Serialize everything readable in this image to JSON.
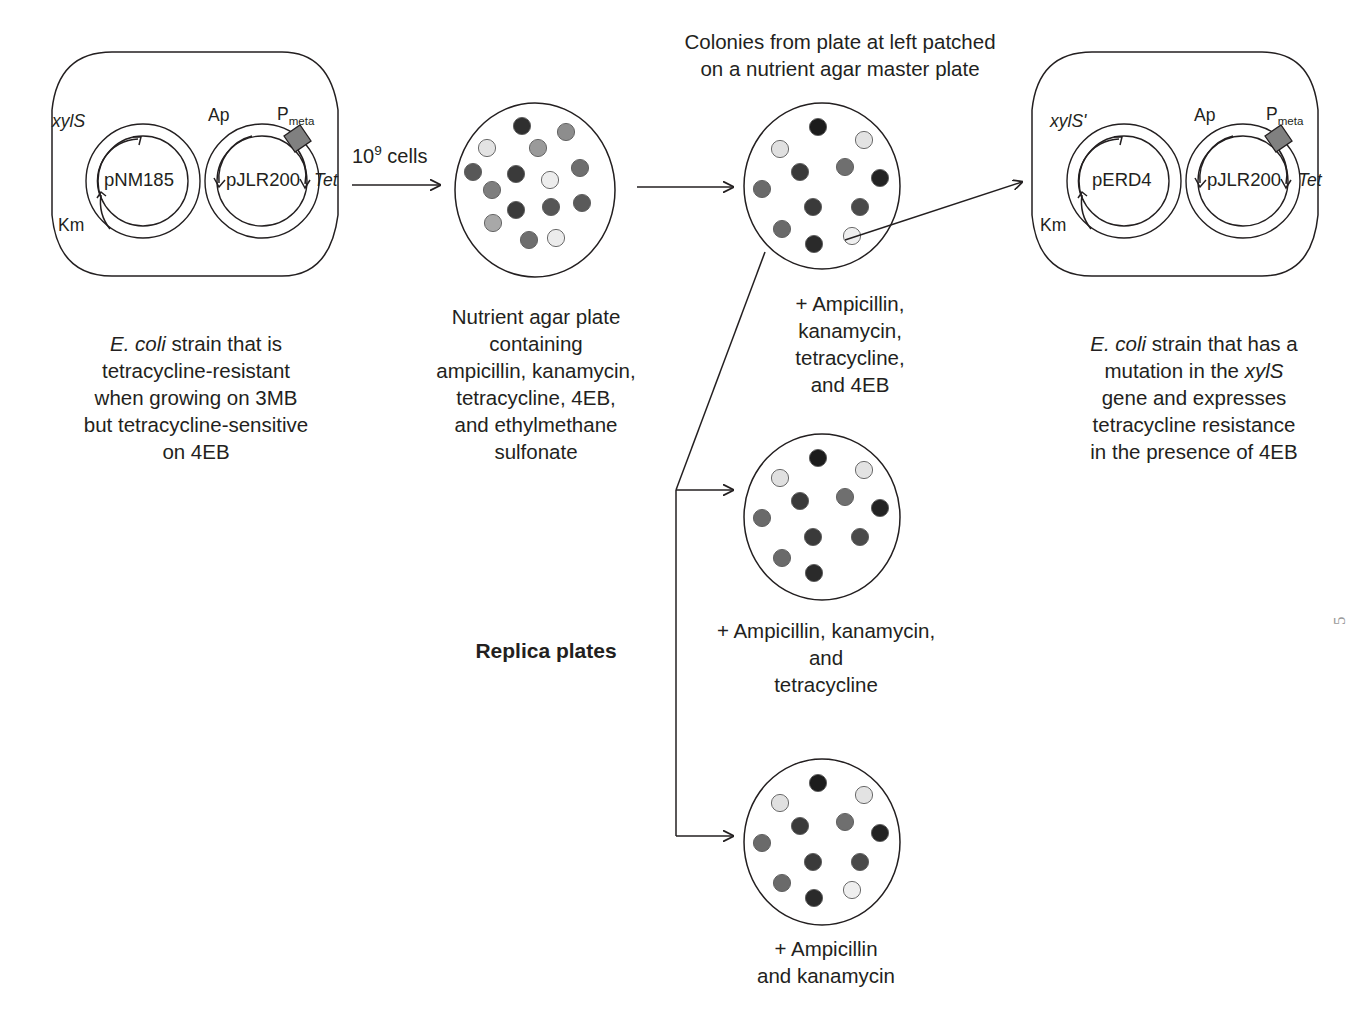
{
  "figure": {
    "type": "biology-workflow-diagram",
    "title_top": "Colonies from plate at left patched\non a nutrient agar master plate"
  },
  "cells": {
    "left": {
      "name": "left-bacterium",
      "plasmids": [
        {
          "name": "pNM185",
          "labels": [
            "xylS",
            "Km"
          ]
        },
        {
          "name": "pJLR200",
          "labels": [
            "Ap",
            "Pmeta",
            "Tet"
          ],
          "p_base": "P",
          "p_sub": "meta"
        }
      ],
      "caption": "E. coli strain that is\ntetracycline-resistant\nwhen growing on 3MB\nbut tetracycline-sensitive\non 4EB",
      "caption_italic_lead": "E. coli"
    },
    "right": {
      "name": "right-bacterium",
      "plasmids": [
        {
          "name": "pERD4",
          "labels": [
            "xylS'",
            "Km"
          ]
        },
        {
          "name": "pJLR200",
          "labels": [
            "Ap",
            "Pmeta",
            "Tet"
          ],
          "p_base": "P",
          "p_sub": "meta"
        }
      ],
      "caption": "E. coli strain that has a\nmutation in the xylS\ngene and expresses\ntetracycline resistance\nin the presence of 4EB",
      "caption_italic_lead": "E. coli",
      "caption_italic_gene": "xylS"
    }
  },
  "labels": {
    "xylS": "xylS",
    "xylS_prime": "xylS'",
    "Km": "Km",
    "Ap": "Ap",
    "Tet": "Tet",
    "P": "P",
    "meta": "meta",
    "pNM185": "pNM185",
    "pJLR200": "pJLR200",
    "pERD4": "pERD4",
    "inoculum": "10",
    "inoculum_exp": "9",
    "inoculum_unit": " cells",
    "replica_plates": "Replica plates"
  },
  "plates": [
    {
      "id": "selection-plate",
      "name": "nutrient-agar-selection-plate",
      "cx": 535,
      "cy": 190,
      "rx": 80,
      "ry": 87,
      "caption": "Nutrient agar plate\ncontaining\nampicillin, kanamycin,\ntetracycline, 4EB,\nand ethylmethane\nsulfonate",
      "colonies": [
        {
          "x": 522,
          "y": 126,
          "shade": "#2f2f2f"
        },
        {
          "x": 566,
          "y": 132,
          "shade": "#8d8d8d"
        },
        {
          "x": 487,
          "y": 148,
          "shade": "#e3e3e3"
        },
        {
          "x": 538,
          "y": 148,
          "shade": "#9a9a9a"
        },
        {
          "x": 516,
          "y": 174,
          "shade": "#3a3a3a"
        },
        {
          "x": 580,
          "y": 168,
          "shade": "#6e6e6e"
        },
        {
          "x": 473,
          "y": 172,
          "shade": "#585858"
        },
        {
          "x": 550,
          "y": 180,
          "shade": "#ededed"
        },
        {
          "x": 492,
          "y": 190,
          "shade": "#7e7e7e"
        },
        {
          "x": 582,
          "y": 203,
          "shade": "#5a5a5a"
        },
        {
          "x": 551,
          "y": 207,
          "shade": "#565656"
        },
        {
          "x": 516,
          "y": 210,
          "shade": "#3b3b3b"
        },
        {
          "x": 493,
          "y": 223,
          "shade": "#a8a8a8"
        },
        {
          "x": 529,
          "y": 240,
          "shade": "#6e6e6e"
        },
        {
          "x": 556,
          "y": 238,
          "shade": "#ececec"
        }
      ]
    },
    {
      "id": "master-plate",
      "name": "master-plate",
      "cx": 822,
      "cy": 186,
      "rx": 78,
      "ry": 83,
      "caption": "+ Ampicillin,\nkanamycin,\ntetracycline,\nand 4EB",
      "colonies": [
        {
          "x": 818,
          "y": 127,
          "shade": "#1c1c1c"
        },
        {
          "x": 864,
          "y": 140,
          "shade": "#e3e3e3"
        },
        {
          "x": 780,
          "y": 149,
          "shade": "#e0e0e0"
        },
        {
          "x": 800,
          "y": 172,
          "shade": "#3a3a3a"
        },
        {
          "x": 845,
          "y": 167,
          "shade": "#6f6f6f"
        },
        {
          "x": 880,
          "y": 178,
          "shade": "#232323"
        },
        {
          "x": 762,
          "y": 189,
          "shade": "#6a6a6a"
        },
        {
          "x": 813,
          "y": 207,
          "shade": "#3a3a3a"
        },
        {
          "x": 860,
          "y": 207,
          "shade": "#4a4a4a"
        },
        {
          "x": 782,
          "y": 229,
          "shade": "#6a6a6a"
        },
        {
          "x": 814,
          "y": 244,
          "shade": "#2a2a2a"
        },
        {
          "x": 852,
          "y": 236,
          "shade": "#efefef"
        }
      ]
    },
    {
      "id": "replica-plate-1",
      "name": "replica-plate-amp-kan-tet",
      "cx": 822,
      "cy": 517,
      "rx": 78,
      "ry": 83,
      "caption": "+ Ampicillin, kanamycin,\nand\ntetracycline",
      "colonies": [
        {
          "x": 818,
          "y": 458,
          "shade": "#1c1c1c"
        },
        {
          "x": 864,
          "y": 470,
          "shade": "#e3e3e3"
        },
        {
          "x": 780,
          "y": 478,
          "shade": "#e0e0e0"
        },
        {
          "x": 800,
          "y": 501,
          "shade": "#3a3a3a"
        },
        {
          "x": 845,
          "y": 497,
          "shade": "#6f6f6f"
        },
        {
          "x": 880,
          "y": 508,
          "shade": "#232323"
        },
        {
          "x": 762,
          "y": 518,
          "shade": "#6a6a6a"
        },
        {
          "x": 813,
          "y": 537,
          "shade": "#3a3a3a"
        },
        {
          "x": 860,
          "y": 537,
          "shade": "#4a4a4a"
        },
        {
          "x": 782,
          "y": 558,
          "shade": "#6a6a6a"
        },
        {
          "x": 814,
          "y": 573,
          "shade": "#2a2a2a"
        }
      ]
    },
    {
      "id": "replica-plate-2",
      "name": "replica-plate-amp-kan",
      "cx": 822,
      "cy": 842,
      "rx": 78,
      "ry": 83,
      "caption": "+ Ampicillin\nand kanamycin",
      "colonies": [
        {
          "x": 818,
          "y": 783,
          "shade": "#1c1c1c"
        },
        {
          "x": 864,
          "y": 795,
          "shade": "#e3e3e3"
        },
        {
          "x": 780,
          "y": 803,
          "shade": "#e0e0e0"
        },
        {
          "x": 800,
          "y": 826,
          "shade": "#3a3a3a"
        },
        {
          "x": 845,
          "y": 822,
          "shade": "#6f6f6f"
        },
        {
          "x": 880,
          "y": 833,
          "shade": "#232323"
        },
        {
          "x": 762,
          "y": 843,
          "shade": "#6a6a6a"
        },
        {
          "x": 813,
          "y": 862,
          "shade": "#3a3a3a"
        },
        {
          "x": 860,
          "y": 862,
          "shade": "#4a4a4a"
        },
        {
          "x": 782,
          "y": 883,
          "shade": "#6a6a6a"
        },
        {
          "x": 814,
          "y": 898,
          "shade": "#2a2a2a"
        },
        {
          "x": 852,
          "y": 890,
          "shade": "#efefef"
        }
      ]
    }
  ],
  "colors": {
    "stroke": "#231f20",
    "text": "#231f20",
    "pmeta_fill": "#808080",
    "background": "#ffffff"
  },
  "artifact": {
    "text": "5"
  }
}
